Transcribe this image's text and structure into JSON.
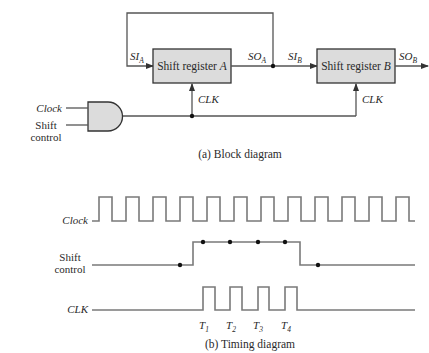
{
  "block_diagram": {
    "caption": "(a) Block diagram",
    "register_a": {
      "label": "Shift register ",
      "suffix": "A"
    },
    "register_b": {
      "label": "Shift register ",
      "suffix": "B"
    },
    "signals": {
      "si_a": {
        "base": "SI",
        "sub": "A"
      },
      "so_a": {
        "base": "SO",
        "sub": "A"
      },
      "si_b": {
        "base": "SI",
        "sub": "B"
      },
      "so_b": {
        "base": "SO",
        "sub": "B"
      },
      "clk_a": "CLK",
      "clk_b": "CLK"
    },
    "gate": {
      "type": "AND",
      "input_clock": "Clock",
      "input_shift_line1": "Shift",
      "input_shift_line2": "control"
    },
    "colors": {
      "box_fill": "#dcdcdc",
      "line": "#555555"
    }
  },
  "timing_diagram": {
    "caption": "(b) Timing diagram",
    "rows": {
      "clock": "Clock",
      "shift_line1": "Shift",
      "shift_line2": "control",
      "clk": "CLK"
    },
    "pulse_labels": [
      {
        "base": "T",
        "sub": "1"
      },
      {
        "base": "T",
        "sub": "2"
      },
      {
        "base": "T",
        "sub": "3"
      },
      {
        "base": "T",
        "sub": "4"
      }
    ],
    "clock_pulses": 12,
    "clk_pulses": 4,
    "colors": {
      "wave": "#7a7a7a"
    }
  }
}
